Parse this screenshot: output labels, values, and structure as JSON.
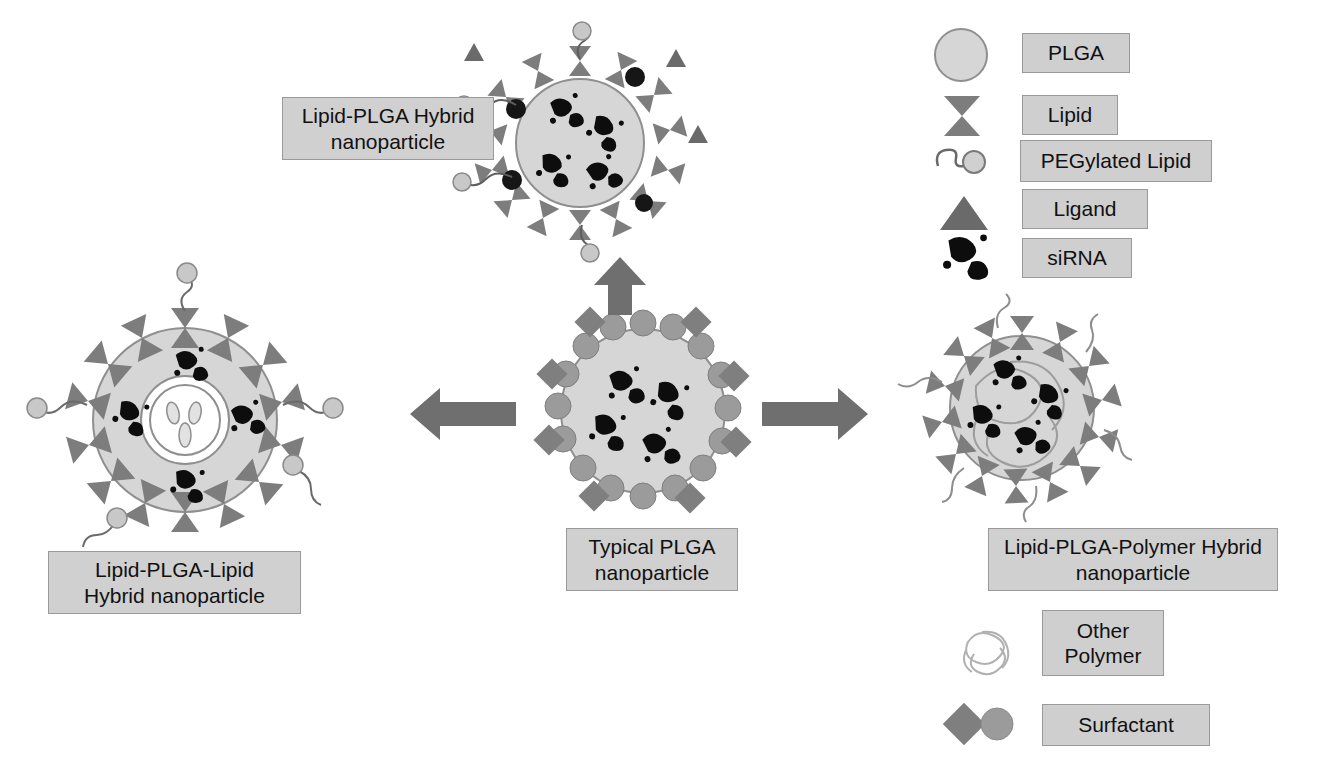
{
  "figure": {
    "type": "scientific-schematic",
    "background_color": "#ffffff"
  },
  "colors": {
    "plga_fill": "#d6d6d6",
    "plga_stroke": "#8f8f8f",
    "lipid": "#7d7d7d",
    "lipid_dark": "#6f6f6f",
    "ligand": "#6a6a6a",
    "peg_head": "#c8c8c8",
    "peg_tail": "#7a7a7a",
    "sirna": "#0d0d0d",
    "dark_sphere": "#161616",
    "surfactant_diamond": "#7f7f7f",
    "surfactant_circle": "#9b9b9b",
    "other_polymer": "#b4b4b4",
    "arrow": "#6f6f6f",
    "label_fill": "#d0d0d0",
    "label_stroke": "#9a9a9a"
  },
  "particles": [
    {
      "id": "lipid-plga-hybrid",
      "label": "Lipid-PLGA Hybrid\nnanoparticle",
      "position": "top-center",
      "core": "PLGA",
      "shell": "lipid monolayer",
      "components": [
        "PLGA",
        "Lipid",
        "PEGylated Lipid",
        "Ligand",
        "siRNA"
      ],
      "sirna_count": 4
    },
    {
      "id": "typical-plga",
      "label": "Typical PLGA\nnanoparticle",
      "position": "center",
      "core": "PLGA",
      "shell": "surfactant layer",
      "components": [
        "PLGA",
        "Surfactant",
        "siRNA"
      ],
      "sirna_count": 4
    },
    {
      "id": "lipid-plga-lipid-hybrid",
      "label": "Lipid-PLGA-Lipid\nHybrid nanoparticle",
      "position": "left",
      "core": "inner lipid vesicle",
      "shell": "lipid monolayer",
      "components": [
        "PLGA",
        "Lipid",
        "PEGylated Lipid",
        "siRNA"
      ],
      "sirna_count": 4
    },
    {
      "id": "lipid-plga-polymer-hybrid",
      "label": "Lipid-PLGA-Polymer Hybrid\nnanoparticle",
      "position": "right",
      "core": "PLGA with other polymer",
      "shell": "lipid monolayer",
      "components": [
        "PLGA",
        "Lipid",
        "PEGylated Lipid",
        "Other Polymer",
        "siRNA"
      ],
      "sirna_count": 4
    }
  ],
  "arrows": [
    {
      "id": "arrow-up",
      "direction": "up",
      "from": "typical-plga",
      "to": "lipid-plga-hybrid"
    },
    {
      "id": "arrow-left",
      "direction": "left",
      "from": "typical-plga",
      "to": "lipid-plga-lipid-hybrid"
    },
    {
      "id": "arrow-right",
      "direction": "right",
      "from": "typical-plga",
      "to": "lipid-plga-polymer-hybrid"
    }
  ],
  "legend_main": {
    "items": [
      {
        "icon": "plga-circle-icon",
        "label": "PLGA"
      },
      {
        "icon": "lipid-bowtie-icon",
        "label": "Lipid"
      },
      {
        "icon": "pegylated-lipid-icon",
        "label": "PEGylated Lipid"
      },
      {
        "icon": "ligand-triangle-icon",
        "label": "Ligand"
      },
      {
        "icon": "sirna-blob-icon",
        "label": "siRNA"
      }
    ]
  },
  "legend_secondary": {
    "items": [
      {
        "icon": "other-polymer-coil-icon",
        "label": "Other\nPolymer"
      },
      {
        "icon": "surfactant-diamond-circle-icon",
        "label": "Surfactant"
      }
    ]
  }
}
